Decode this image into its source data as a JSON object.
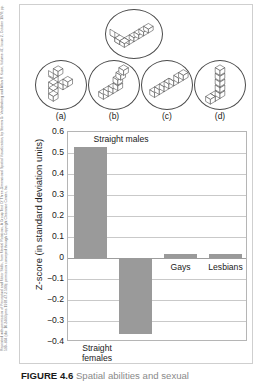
{
  "credit": {
    "text": "Reprinted with permission of Perceptual and Motor Skills, from Mental Rotations, A Group Test Of Three-Dimensional Spatial Visualization, by Steven G. Vandenberg and Allan R. Kuse, Volume 47, Issue 2, October 1978; pp. 599–604 (doi: 10.2466/pms.1978.47.2.599); permission conveyed through Copyright Clearance Center, Inc."
  },
  "stimuli": {
    "target_name": "mental-rotation-target-figure",
    "options": [
      {
        "label": "(a)",
        "name": "mental-rotation-option-a"
      },
      {
        "label": "(b)",
        "name": "mental-rotation-option-b"
      },
      {
        "label": "(c)",
        "name": "mental-rotation-option-c"
      },
      {
        "label": "(d)",
        "name": "mental-rotation-option-d"
      }
    ]
  },
  "chart_data": {
    "type": "bar",
    "title": "",
    "xlabel": "",
    "ylabel": "Z-score (in standard deviation units)",
    "ylim": [
      -0.4,
      0.6
    ],
    "yticks": [
      "0.6",
      "0.5",
      "0.4",
      "0.3",
      "0.2",
      "0.1",
      "0",
      "-0.1",
      "-0.2",
      "-0.3",
      "-0.4"
    ],
    "ytick_values": [
      0.6,
      0.5,
      0.4,
      0.3,
      0.2,
      0.1,
      0,
      -0.1,
      -0.2,
      -0.3,
      -0.4
    ],
    "grid": true,
    "legend": "none",
    "categories": [
      "Straight males",
      "Straight females",
      "Gays",
      "Lesbians"
    ],
    "values": [
      0.53,
      -0.36,
      0.02,
      0.02
    ],
    "bar_color": "#9a9a9a",
    "labels": {
      "straight_males": "Straight males",
      "straight_females_line1": "Straight",
      "straight_females_line2": "females",
      "gays": "Gays",
      "lesbians": "Lesbians"
    }
  },
  "caption": {
    "figure_number": "FIGURE 4.6",
    "text": "Spatial abilities and sexual"
  }
}
